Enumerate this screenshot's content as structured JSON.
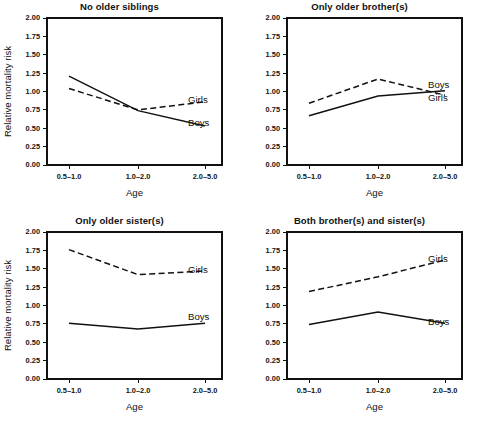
{
  "figure": {
    "background": "#ffffff",
    "ink_color": "#111111",
    "xlabel": "Age",
    "ylabel": "Relative mortality risk",
    "xtick_labels": [
      "0.5–1.0",
      "1.0–2.0",
      "2.0–5.0"
    ],
    "ytick_labels": [
      "0.00",
      "0.25",
      "0.50",
      "0.75",
      "1.00",
      "1.25",
      "1.50",
      "1.75",
      "2.00"
    ],
    "series_labels": {
      "boys": "Boys",
      "girls": "Girls"
    }
  },
  "chart_data": [
    {
      "type": "line",
      "title": "No older siblings",
      "xlabel": "Age",
      "ylabel": "Relative mortality risk",
      "categories": [
        "0.5–1.0",
        "1.0–2.0",
        "2.0–5.0"
      ],
      "ylim": [
        0.0,
        2.0
      ],
      "yticks": [
        0.0,
        0.25,
        0.5,
        0.75,
        1.0,
        1.25,
        1.5,
        1.75,
        2.0
      ],
      "grid": false,
      "legend": "inline-right-labels",
      "show_ylabel": true,
      "series": [
        {
          "name": "Boys",
          "style": "solid",
          "values": [
            1.21,
            0.74,
            0.53
          ],
          "label_y": 0.56
        },
        {
          "name": "Girls",
          "style": "dashed",
          "values": [
            1.04,
            0.75,
            0.86
          ],
          "label_y": 0.88
        }
      ]
    },
    {
      "type": "line",
      "title": "Only older brother(s)",
      "xlabel": "Age",
      "ylabel": "Relative mortality risk",
      "categories": [
        "0.5–1.0",
        "1.0–2.0",
        "2.0–5.0"
      ],
      "ylim": [
        0.0,
        2.0
      ],
      "yticks": [
        0.0,
        0.25,
        0.5,
        0.75,
        1.0,
        1.25,
        1.5,
        1.75,
        2.0
      ],
      "grid": false,
      "legend": "inline-right-labels",
      "show_ylabel": false,
      "series": [
        {
          "name": "Boys",
          "style": "solid",
          "values": [
            0.67,
            0.94,
            1.01
          ],
          "label_y": 1.08
        },
        {
          "name": "Girls",
          "style": "dashed",
          "values": [
            0.84,
            1.17,
            0.95
          ],
          "label_y": 0.9
        }
      ]
    },
    {
      "type": "line",
      "title": "Only older sister(s)",
      "xlabel": "Age",
      "ylabel": "Relative mortality risk",
      "categories": [
        "0.5–1.0",
        "1.0–2.0",
        "2.0–5.0"
      ],
      "ylim": [
        0.0,
        2.0
      ],
      "yticks": [
        0.0,
        0.25,
        0.5,
        0.75,
        1.0,
        1.25,
        1.5,
        1.75,
        2.0
      ],
      "grid": false,
      "legend": "inline-right-labels",
      "show_ylabel": true,
      "series": [
        {
          "name": "Boys",
          "style": "solid",
          "values": [
            0.76,
            0.68,
            0.76
          ],
          "label_y": 0.84
        },
        {
          "name": "Girls",
          "style": "dashed",
          "values": [
            1.76,
            1.42,
            1.47
          ],
          "label_y": 1.48
        }
      ]
    },
    {
      "type": "line",
      "title": "Both brother(s) and sister(s)",
      "xlabel": "Age",
      "ylabel": "Relative mortality risk",
      "categories": [
        "0.5–1.0",
        "1.0–2.0",
        "2.0–5.0"
      ],
      "ylim": [
        0.0,
        2.0
      ],
      "yticks": [
        0.0,
        0.25,
        0.5,
        0.75,
        1.0,
        1.25,
        1.5,
        1.75,
        2.0
      ],
      "grid": false,
      "legend": "inline-right-labels",
      "show_ylabel": false,
      "series": [
        {
          "name": "Boys",
          "style": "solid",
          "values": [
            0.74,
            0.91,
            0.76
          ],
          "label_y": 0.77
        },
        {
          "name": "Girls",
          "style": "dashed",
          "values": [
            1.19,
            1.39,
            1.62
          ],
          "label_y": 1.63
        }
      ]
    }
  ]
}
